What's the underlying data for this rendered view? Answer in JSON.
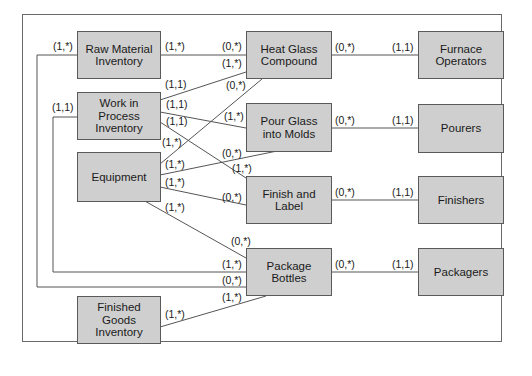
{
  "diagram": {
    "title": "",
    "entities": {
      "raw_material_inventory": "Raw Material\nInventory",
      "work_in_process_inventory": "Work in\nProcess\nInventory",
      "equipment": "Equipment",
      "finished_goods_inventory": "Finished\nGoods\nInventory",
      "heat_glass_compound": "Heat Glass\nCompound",
      "pour_glass_into_molds": "Pour Glass\ninto Molds",
      "finish_and_label": "Finish and\nLabel",
      "package_bottles": "Package\nBottles",
      "furnace_operators": "Furnace\nOperators",
      "pourers": "Pourers",
      "finishers": "Finishers",
      "packagers": "Packagers"
    },
    "cardinalities": {
      "rmi_left": "(1,*)",
      "rmi_to_hgc": "(1,*)",
      "hgc_from_rmi": "(0,*)",
      "hgc_from_wip": "(1,*)",
      "hgc_from_eq": "(0,*)",
      "wip_left": "(1,1)",
      "wip_to_hgc": "(1,1)",
      "wip_to_pgm": "(1,1)",
      "wip_to_fl": "(1,1)",
      "pgm_from_wip": "(1,*)",
      "eq_to_hgc": "(1,*)",
      "pgm_from_eq": "(0,*)",
      "eq_to_pgm": "(1,*)",
      "fl_from_wip": "(1,*)",
      "eq_to_fl": "(1,*)",
      "fl_from_eq": "(0,*)",
      "eq_to_pb": "(1,*)",
      "pb_from_eq": "(0,*)",
      "pb_from_wip": "(1,*)",
      "pb_from_rmi": "(0,*)",
      "pb_from_fgi": "(1,*)",
      "fgi_to_pb": "(1,*)",
      "hgc_to_fo": "(0,*)",
      "fo_from_hgc": "(1,1)",
      "pgm_to_pourers": "(0,*)",
      "pourers_from_pgm": "(1,1)",
      "fl_to_finishers": "(0,*)",
      "finishers_from_fl": "(1,1)",
      "pb_to_packagers": "(0,*)",
      "packagers_from_pb": "(1,1)"
    },
    "colors": {
      "box_fill": "#cfcfcf",
      "box_border": "#5a5a5a",
      "line": "#555555"
    }
  }
}
